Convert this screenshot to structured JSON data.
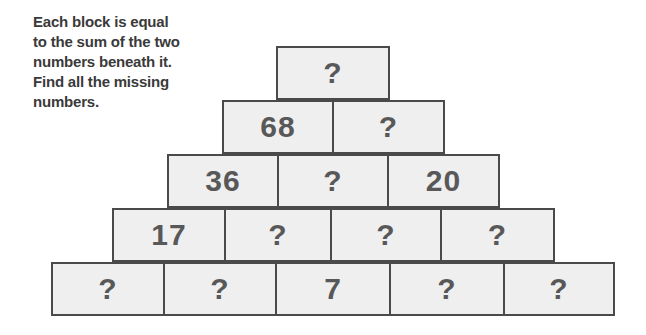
{
  "instructions": {
    "lines": [
      "Each block is equal",
      "to the sum of the two",
      "numbers beneath it.",
      "Find all the missing",
      "numbers."
    ]
  },
  "pyramid": {
    "rows": [
      {
        "blocks": [
          "?"
        ]
      },
      {
        "blocks": [
          "68",
          "?"
        ]
      },
      {
        "blocks": [
          "36",
          "?",
          "20"
        ]
      },
      {
        "blocks": [
          "17",
          "?",
          "?",
          "?"
        ]
      },
      {
        "blocks": [
          "?",
          "?",
          "7",
          "?",
          "?"
        ]
      }
    ]
  },
  "colors": {
    "block_fill": "#efefef",
    "block_border": "#4a4a4a",
    "number_text": "#585858",
    "instruction_text": "#3a3a3a"
  }
}
